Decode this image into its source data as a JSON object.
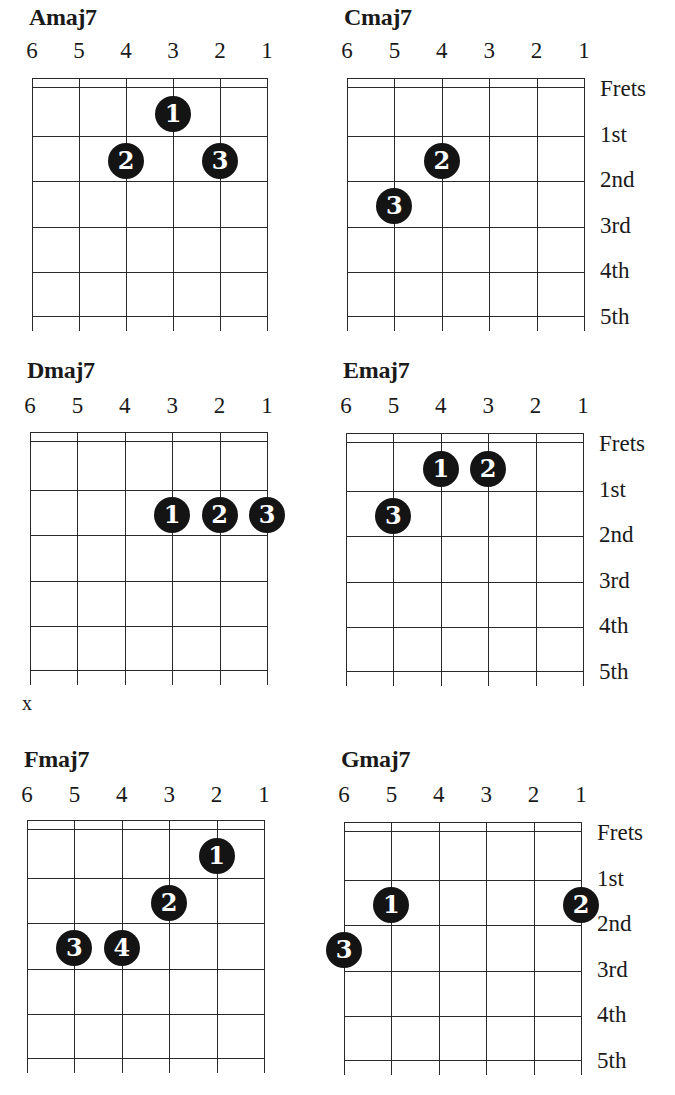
{
  "strings_header": [
    "6",
    "5",
    "4",
    "3",
    "2",
    "1"
  ],
  "fret_labels": [
    "Frets",
    "1st",
    "2nd",
    "3rd",
    "4th",
    "5th"
  ],
  "chords": [
    {
      "name": "Amaj7",
      "fingers": [
        {
          "finger": "1",
          "string": 3,
          "fret": 1
        },
        {
          "finger": "2",
          "string": 4,
          "fret": 2
        },
        {
          "finger": "3",
          "string": 2,
          "fret": 2
        }
      ],
      "muted": []
    },
    {
      "name": "Cmaj7",
      "fingers": [
        {
          "finger": "2",
          "string": 4,
          "fret": 2
        },
        {
          "finger": "3",
          "string": 5,
          "fret": 3
        }
      ],
      "muted": []
    },
    {
      "name": "Dmaj7",
      "fingers": [
        {
          "finger": "1",
          "string": 3,
          "fret": 2
        },
        {
          "finger": "2",
          "string": 2,
          "fret": 2
        },
        {
          "finger": "3",
          "string": 1,
          "fret": 2
        }
      ],
      "muted": [
        "x"
      ]
    },
    {
      "name": "Emaj7",
      "fingers": [
        {
          "finger": "1",
          "string": 4,
          "fret": 1
        },
        {
          "finger": "2",
          "string": 3,
          "fret": 1
        },
        {
          "finger": "3",
          "string": 5,
          "fret": 2
        }
      ],
      "muted": []
    },
    {
      "name": "Fmaj7",
      "fingers": [
        {
          "finger": "1",
          "string": 2,
          "fret": 1
        },
        {
          "finger": "2",
          "string": 3,
          "fret": 2
        },
        {
          "finger": "3",
          "string": 5,
          "fret": 3
        },
        {
          "finger": "4",
          "string": 4,
          "fret": 3
        }
      ],
      "muted": []
    },
    {
      "name": "Gmaj7",
      "fingers": [
        {
          "finger": "1",
          "string": 5,
          "fret": 2
        },
        {
          "finger": "2",
          "string": 1,
          "fret": 2
        },
        {
          "finger": "3",
          "string": 6,
          "fret": 3
        }
      ],
      "muted": []
    }
  ],
  "mute_mark": "x"
}
